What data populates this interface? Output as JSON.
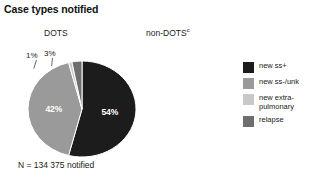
{
  "title": "Case types notified",
  "columns": {
    "dots": "DOTS",
    "non_dots": "non-DOTS",
    "non_dots_footnote": "c"
  },
  "dots_total": "N = 134 375 notified",
  "legend": {
    "items": [
      {
        "label": "new ss+",
        "color": "#1c1c1c"
      },
      {
        "label": "new ss-/unk",
        "color": "#9a9a9a"
      },
      {
        "label": "new extra-pulmonary",
        "color": "#c9c9c9"
      },
      {
        "label": "relapse",
        "color": "#6e6e6e"
      }
    ]
  },
  "chart_data": {
    "type": "pie",
    "title": "Case types notified",
    "panels": [
      {
        "name": "DOTS",
        "total_label": "N = 134 375 notified",
        "total_value": 134375,
        "categories": [
          "new ss+",
          "new ss-/unk",
          "new extra-pulmonary",
          "relapse"
        ],
        "values": [
          54,
          42,
          1,
          3
        ],
        "value_labels": [
          "54%",
          "42%",
          "1%",
          "3%"
        ],
        "colors": [
          "#1c1c1c",
          "#9a9a9a",
          "#c9c9c9",
          "#6e6e6e"
        ],
        "units": "percent"
      },
      {
        "name": "non-DOTS",
        "total_label": "",
        "categories": [],
        "values": [],
        "value_labels": [],
        "colors": []
      }
    ],
    "legend_position": "right",
    "grid": false
  }
}
